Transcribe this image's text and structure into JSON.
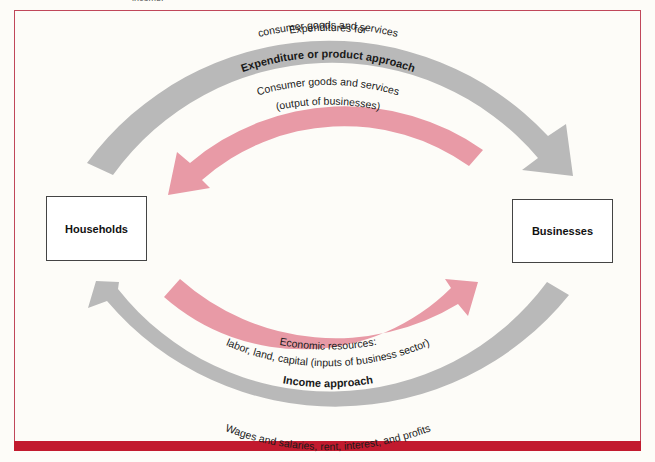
{
  "caption_fragment": "income.",
  "nodes": {
    "households": "Households",
    "businesses": "Businesses"
  },
  "flows": {
    "top_outer": {
      "line1": "Expenditures for",
      "line2": "consumer goods and services",
      "direction": "Households → Businesses",
      "color": "#b9b9b9"
    },
    "top_label": "Expenditure or product approach",
    "top_inner": {
      "line1": "Consumer goods and services",
      "line2": "(output of businesses)",
      "direction": "Businesses → Households",
      "color": "#e89aa6"
    },
    "bottom_inner": {
      "line1": "Economic resources:",
      "line2": "labor, land, capital (inputs of business sector)",
      "direction": "Households → Businesses",
      "color": "#e89aa6"
    },
    "bottom_label": "Income approach",
    "bottom_outer": {
      "line1": "Wages and salaries, rent, interest, and profits",
      "direction": "Businesses → Households",
      "color": "#b9b9b9"
    }
  },
  "colors": {
    "frame": "#c0475a",
    "bottom_band": "#c21a2e",
    "gray_arrow": "#b9b9b9",
    "pink_arrow": "#e89aa6"
  }
}
